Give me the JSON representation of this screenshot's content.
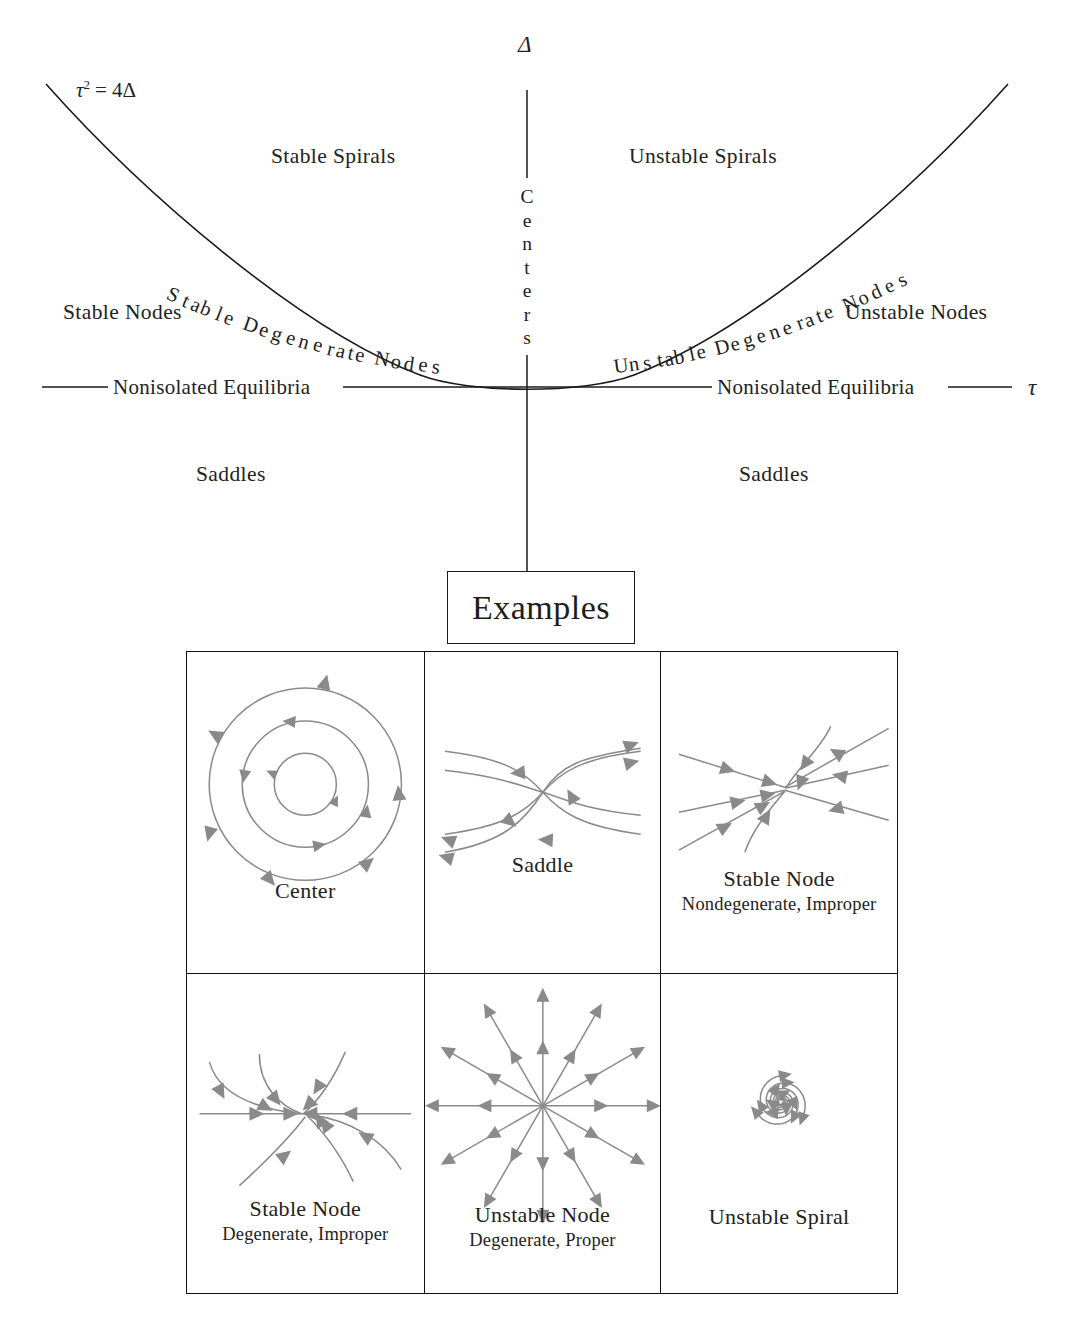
{
  "figure": {
    "axes": {
      "vertical_symbol": "Δ",
      "horizontal_symbol": "τ",
      "vertical_label_letters": [
        "C",
        "e",
        "n",
        "t",
        "e",
        "r",
        "s"
      ],
      "vertical_label_text": "Centers"
    },
    "curve_equation": "τ² = 4Δ",
    "curve_equation_parts": {
      "base": "τ",
      "exponent": "2",
      "rhs": "= 4Δ"
    },
    "regions": [
      {
        "id": "stable-spirals",
        "label": "Stable Spirals"
      },
      {
        "id": "unstable-spirals",
        "label": "Unstable Spirals"
      },
      {
        "id": "stable-nodes",
        "label": "Stable Nodes"
      },
      {
        "id": "unstable-nodes",
        "label": "Unstable Nodes"
      },
      {
        "id": "saddles-left",
        "label": "Saddles"
      },
      {
        "id": "saddles-right",
        "label": "Saddles"
      }
    ],
    "curve_labels": [
      {
        "id": "stable-degenerate-nodes",
        "text": "Stable Degenerate Nodes"
      },
      {
        "id": "unstable-degenerate-nodes",
        "text": "Unstable Degenerate Nodes"
      }
    ],
    "axis_labels": [
      {
        "id": "nonisolated-equilibria-left",
        "text": "Nonisolated Equilibria"
      },
      {
        "id": "nonisolated-equilibria-right",
        "text": "Nonisolated Equilibria"
      }
    ],
    "examples_heading": "Examples",
    "examples": [
      {
        "id": "center",
        "title": "Center",
        "subtitle": "",
        "portrait": "concentric-circles-ccw"
      },
      {
        "id": "saddle",
        "title": "Saddle",
        "subtitle": "",
        "portrait": "hyperbolic-saddle"
      },
      {
        "id": "stable-node-nondegenerate",
        "title": "Stable Node",
        "subtitle": "Nondegenerate, Improper",
        "portrait": "inward-improper-node"
      },
      {
        "id": "stable-node-degenerate",
        "title": "Stable Node",
        "subtitle": "Degenerate, Improper",
        "portrait": "inward-degenerate-node"
      },
      {
        "id": "unstable-node-degenerate",
        "title": "Unstable Node",
        "subtitle": "Degenerate, Proper",
        "portrait": "outward-star-node"
      },
      {
        "id": "unstable-spiral",
        "title": "Unstable Spiral",
        "subtitle": "",
        "portrait": "outward-spiral"
      }
    ],
    "colors": {
      "ink": "#1a1a1a",
      "flow": "#8a8a8a",
      "background": "#ffffff"
    }
  },
  "chart_data": {
    "type": "diagram",
    "xlabel": "τ",
    "ylabel": "Δ",
    "curve": {
      "equation": "τ² = 4Δ",
      "vertex": [
        0,
        0
      ]
    },
    "axis_origin_px": [
      527,
      387
    ],
    "annotations": [
      "Stable Spirals",
      "Unstable Spirals",
      "Stable Nodes",
      "Unstable Nodes",
      "Saddles",
      "Saddles",
      "Centers",
      "Stable Degenerate Nodes",
      "Unstable Degenerate Nodes",
      "Nonisolated Equilibria",
      "Nonisolated Equilibria"
    ]
  }
}
